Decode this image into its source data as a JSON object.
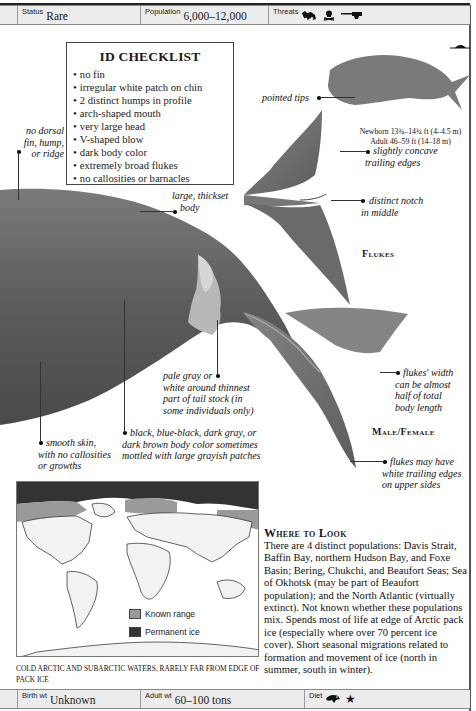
{
  "stats_top": {
    "status": {
      "label": "Status",
      "value": "Rare"
    },
    "population": {
      "label": "Population",
      "value": "6,000–12,000"
    },
    "threats": {
      "label": "Threats",
      "icons": [
        "fishing-vessel-icon",
        "pollution-skull-icon",
        "harpoon-gun-icon"
      ]
    }
  },
  "checklist": {
    "title": "ID CHECKLIST",
    "items": [
      "no fin",
      "irregular white patch on chin",
      "2 distinct humps in profile",
      "arch-shaped mouth",
      "very large head",
      "V-shaped blow",
      "dark body color",
      "extremely broad flukes",
      "no callosities or barnacles"
    ]
  },
  "size": {
    "newborn": "Newborn 13¾–14¾ ft (4–4.5 m)",
    "adult": "Adult 46–59 ft (14–18 m)",
    "diver_icon": "diver-scale-icon"
  },
  "labels": {
    "no_dorsal": [
      "no dorsal",
      "fin, hump,",
      "or ridge"
    ],
    "thickset": [
      "large, thickset",
      "body"
    ],
    "pointed_tips": "pointed tips",
    "concave": [
      "slightly concave",
      "trailing edges"
    ],
    "notch": [
      "distinct notch",
      "in middle"
    ],
    "flukes_caption": "Flukes",
    "pale_gray": [
      "pale gray or",
      "white around thinnest",
      "part of tail stock (in",
      "some individuals only)"
    ],
    "smooth_skin": [
      "smooth skin,",
      "with no callosities",
      "or growths"
    ],
    "body_color": [
      "black, blue-black, dark gray, or",
      "dark brown body color sometimes",
      "mottled with large grayish patches"
    ],
    "flukes_width": [
      "flukes' width",
      "can be almost",
      "half of total",
      "body length"
    ],
    "male_female": "Male/Female",
    "white_edges": [
      "flukes may have",
      "white trailing edges",
      "on upper sides"
    ]
  },
  "map": {
    "legend": [
      {
        "label": "Known range",
        "color": "#9a9a9a"
      },
      {
        "label": "Permanent ice",
        "color": "#333333"
      }
    ],
    "caption": "COLD ARCTIC AND SUBARCTIC WATERS, RARELY FAR FROM EDGE OF PACK ICE"
  },
  "where_to_look": {
    "title": "Where to Look",
    "body": "There are 4 distinct populations: Davis Strait, Baffin Bay, northern Hudson Bay, and Foxe Basin; Bering, Chukchi, and Beaufort Seas; Sea of Okhotsk (may be part of Beaufort population); and the North Atlantic (virtually extinct). Not known whether these populations mix. Spends most of life at edge of Arctic pack ice (especially where over 70 percent ice cover). Short seasonal migrations related to formation and movement of ice (north in summer, south in winter)."
  },
  "stats_bottom": {
    "birth_wt": {
      "label": "Birth wt",
      "value": "Unknown"
    },
    "adult_wt": {
      "label": "Adult wt",
      "value": "60–100 tons"
    },
    "diet": {
      "label": "Diet",
      "icons": [
        "krill-icon",
        "plankton-star-icon"
      ]
    }
  },
  "colors": {
    "whale_dark": "#5a5a5a",
    "whale_mid": "#6e6e6e",
    "stat_bar_bg": "#ececec",
    "range": "#9a9a9a",
    "ice": "#333333"
  }
}
